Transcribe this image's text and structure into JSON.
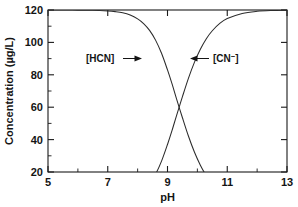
{
  "chart_data": {
    "type": "line",
    "title": "",
    "subtitle": "",
    "xlabel": "pH",
    "ylabel": "Concentration (µg/L)",
    "xlim": [
      5,
      13
    ],
    "ylim": [
      20,
      120
    ],
    "grid": false,
    "legend_position": "inline-annotations",
    "x_ticks_major": [
      5,
      7,
      9,
      11,
      13
    ],
    "x_ticklabels": [
      "5",
      "7",
      "9",
      "11",
      "13"
    ],
    "x_ticks_minor": [
      6,
      8,
      10,
      12
    ],
    "y_ticks_major": [
      20,
      40,
      60,
      80,
      100,
      120
    ],
    "y_ticklabels": [
      "20",
      "40",
      "60",
      "80",
      "100",
      "120"
    ],
    "y_ticks_minor": [
      30,
      50,
      70,
      90,
      110
    ],
    "total_concentration": 120,
    "pKa": 9.15,
    "crossover": {
      "x": 9.15,
      "y": 60
    },
    "x": [
      5.0,
      5.5,
      6.0,
      6.5,
      7.0,
      7.25,
      7.5,
      7.75,
      8.0,
      8.2,
      8.4,
      8.6,
      8.8,
      9.0,
      9.15,
      9.3,
      9.5,
      9.7,
      9.9,
      10.1,
      10.3,
      10.5,
      10.75,
      11.0,
      11.5,
      12.0,
      12.5,
      13.0
    ],
    "series": [
      {
        "name": "[HCN]",
        "label": "[HCN]",
        "annotation_arrow": "right",
        "values": [
          120.0,
          120.0,
          119.9,
          119.8,
          119.4,
          119.0,
          118.3,
          116.9,
          114.5,
          111.6,
          107.4,
          101.4,
          93.3,
          83.0,
          74.5,
          65.3,
          53.5,
          42.2,
          32.3,
          24.2,
          17.7,
          12.8,
          8.3,
          5.3,
          2.1,
          0.8,
          0.3,
          0.1
        ]
      },
      {
        "name": "[CN-]",
        "label": "[CN⁻]",
        "annotation_arrow": "left",
        "values": [
          0.0,
          0.0,
          0.1,
          0.2,
          0.6,
          1.0,
          1.7,
          3.1,
          5.5,
          8.4,
          12.6,
          18.6,
          26.7,
          37.0,
          45.5,
          54.7,
          66.5,
          77.8,
          87.7,
          95.8,
          102.3,
          107.2,
          111.7,
          114.7,
          117.9,
          119.2,
          119.7,
          119.9
        ]
      }
    ],
    "annotations": [
      {
        "text": "[HCN]",
        "x": 7.45,
        "y": 99,
        "arrow_to_x": 8.42,
        "arrow_dir": "right"
      },
      {
        "text": "[CN⁻]",
        "x": 10.6,
        "y": 99,
        "arrow_to_x": 9.88,
        "arrow_dir": "left"
      }
    ]
  }
}
